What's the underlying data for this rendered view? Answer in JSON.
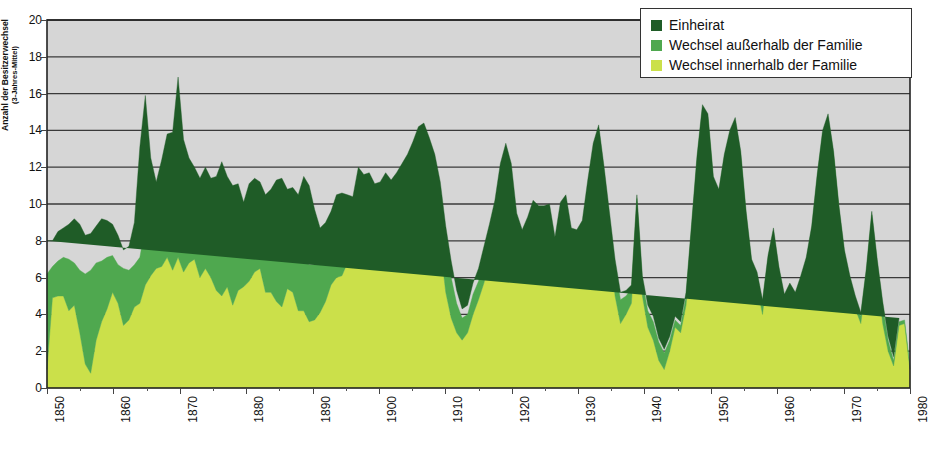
{
  "chart_data": {
    "type": "area",
    "stacked": true,
    "title": "",
    "xlabel": "",
    "ylabel": "Anzahl der Besitzerwechsel",
    "ylabel_sub": "(3-Jahres-Mittel)",
    "ylim": [
      0,
      20
    ],
    "ytick_step": 2,
    "yticks": [
      0,
      2,
      4,
      6,
      8,
      10,
      12,
      14,
      16,
      18,
      20
    ],
    "xlim": [
      1850,
      1980
    ],
    "xticks": [
      1850,
      1860,
      1870,
      1880,
      1890,
      1900,
      1910,
      1920,
      1930,
      1940,
      1950,
      1960,
      1970,
      1980
    ],
    "xtick_labels": [
      "1850",
      "1860",
      "1870",
      "1880",
      "1890",
      "1900",
      "1910",
      "1920",
      "1930",
      "1940",
      "1950",
      "1960",
      "1970",
      "1980"
    ],
    "x_minor_step": 5,
    "grid": true,
    "grid_axis": "y",
    "plot_background": "#d6d6d6",
    "legend_position": "top-right",
    "series": [
      {
        "name": "Wechsel innerhalb der Familie",
        "color": "#cbe04a",
        "stack_order": 1,
        "values": [
          1.0,
          4.9,
          5.0,
          5.0,
          4.2,
          4.5,
          3.0,
          1.3,
          0.8,
          2.6,
          3.6,
          4.3,
          5.2,
          4.6,
          3.4,
          3.7,
          4.4,
          4.6,
          5.6,
          6.1,
          6.5,
          6.6,
          7.1,
          6.4,
          7.1,
          6.3,
          6.8,
          7.0,
          6.0,
          6.5,
          6.0,
          5.3,
          5.0,
          5.5,
          4.5,
          5.3,
          5.5,
          5.8,
          6.3,
          6.5,
          5.2,
          5.2,
          4.7,
          4.4,
          5.4,
          5.2,
          4.2,
          4.2,
          3.6,
          3.7,
          4.1,
          4.7,
          5.6,
          6.0,
          6.1,
          6.8,
          7.2,
          8.7,
          7.2,
          7.1,
          6.6,
          7.1,
          8.0,
          8.3,
          9.0,
          9.3,
          10.0,
          10.7,
          11.1,
          11.7,
          10.5,
          9.4,
          7.8,
          5.2,
          3.8,
          3.0,
          2.6,
          3.0,
          4.0,
          4.8,
          5.7,
          6.9,
          8.4,
          10.5,
          11.4,
          10.2,
          7.2,
          6.3,
          7.4,
          8.5,
          8.4,
          8.5,
          8.5,
          6.3,
          8.5,
          9.2,
          7.0,
          6.8,
          7.5,
          9.9,
          12.0,
          13.3,
          10.7,
          7.8,
          5.0,
          3.5,
          4.0,
          4.6,
          9.6,
          5.0,
          3.3,
          2.6,
          1.5,
          1.0,
          2.0,
          3.3,
          3.0,
          4.5,
          8.0,
          11.8,
          14.7,
          14.3,
          11.0,
          10.3,
          12.0,
          13.2,
          14.0,
          12.3,
          9.0,
          6.3,
          5.5,
          4.0,
          6.5,
          8.0,
          6.0,
          4.5,
          5.0,
          4.5,
          5.3,
          6.2,
          8.0,
          11.0,
          13.5,
          14.5,
          12.5,
          9.5,
          7.0,
          5.5,
          4.3,
          3.5,
          6.0,
          9.0,
          6.0,
          3.5,
          2.0,
          1.2,
          3.4,
          3.5,
          1.0
        ]
      },
      {
        "name": "Wechsel außerhalb der Familie",
        "color": "#4fa84f",
        "stack_order": 2,
        "values": [
          5.2,
          1.7,
          1.9,
          2.1,
          2.8,
          2.3,
          3.4,
          4.9,
          5.6,
          4.2,
          3.3,
          2.8,
          2.0,
          2.1,
          3.1,
          2.7,
          2.3,
          2.5,
          3.2,
          2.2,
          1.9,
          1.8,
          2.7,
          3.3,
          4.0,
          3.2,
          2.7,
          2.1,
          2.4,
          2.6,
          2.4,
          2.6,
          2.8,
          2.7,
          3.5,
          2.8,
          2.4,
          2.8,
          2.2,
          2.3,
          2.8,
          2.9,
          3.1,
          3.0,
          2.4,
          2.5,
          2.9,
          2.8,
          3.1,
          3.0,
          2.6,
          2.4,
          2.0,
          2.2,
          2.5,
          2.3,
          2.0,
          1.5,
          2.4,
          2.6,
          2.8,
          2.6,
          2.3,
          2.0,
          1.7,
          1.9,
          1.6,
          1.4,
          1.5,
          1.2,
          1.7,
          2.0,
          2.3,
          2.6,
          2.2,
          1.6,
          1.2,
          1.0,
          1.1,
          1.0,
          1.2,
          1.1,
          1.0,
          0.9,
          0.9,
          1.0,
          1.5,
          1.7,
          1.4,
          1.2,
          1.1,
          1.0,
          1.0,
          1.4,
          1.1,
          0.9,
          1.3,
          1.4,
          1.2,
          1.0,
          0.9,
          0.8,
          1.0,
          1.3,
          1.5,
          1.3,
          1.0,
          0.8,
          0.7,
          0.8,
          0.9,
          1.0,
          1.0,
          0.9,
          0.6,
          0.4,
          0.4,
          0.5,
          0.7,
          0.6,
          0.5,
          0.4,
          0.3,
          0.3,
          0.5,
          0.6,
          0.5,
          0.4,
          0.4,
          0.5,
          0.6,
          0.6,
          0.5,
          0.5,
          0.4,
          0.4,
          0.5,
          0.5,
          0.6,
          0.7,
          0.6,
          0.4,
          0.3,
          0.2,
          0.2,
          0.2,
          0.3,
          0.4,
          0.5,
          0.4,
          0.3,
          0.4,
          0.8,
          1.0,
          0.6,
          0.3,
          0.2,
          0.2,
          0.2,
          0.2
        ]
      },
      {
        "name": "Einheirat",
        "color": "#1f5c27",
        "stack_order": 3,
        "values": [
          1.8,
          1.4,
          1.6,
          1.6,
          1.9,
          2.4,
          2.5,
          2.1,
          2.0,
          2.0,
          2.3,
          2.0,
          1.7,
          1.6,
          1.0,
          1.3,
          2.3,
          6.0,
          7.1,
          4.2,
          2.8,
          4.0,
          4.0,
          4.2,
          5.8,
          4.0,
          3.0,
          2.9,
          3.0,
          2.9,
          3.0,
          3.6,
          4.5,
          3.3,
          3.0,
          3.0,
          2.2,
          2.5,
          2.9,
          2.4,
          2.5,
          2.7,
          3.5,
          4.0,
          3.0,
          3.2,
          3.4,
          4.5,
          4.3,
          3.0,
          2.0,
          1.9,
          2.0,
          2.3,
          2.0,
          1.4,
          1.2,
          1.8,
          2.0,
          2.0,
          1.7,
          1.5,
          1.4,
          1.0,
          1.0,
          1.0,
          1.1,
          1.3,
          1.6,
          1.5,
          1.4,
          1.3,
          1.1,
          1.0,
          0.9,
          0.7,
          0.5,
          0.5,
          0.6,
          0.7,
          0.8,
          0.9,
          0.8,
          0.8,
          1.0,
          1.0,
          0.8,
          0.6,
          0.5,
          0.5,
          0.4,
          0.4,
          0.5,
          0.5,
          0.5,
          0.4,
          0.4,
          0.4,
          0.4,
          0.4,
          0.4,
          0.2,
          0.3,
          0.4,
          0.5,
          0.4,
          0.3,
          0.2,
          0.2,
          0.3,
          0.3,
          0.3,
          0.2,
          0.2,
          0.2,
          0.2,
          0.2,
          0.2,
          0.2,
          0.2,
          0.2,
          0.2,
          0.2,
          0.2,
          0.2,
          0.2,
          0.2,
          0.2,
          0.2,
          0.2,
          0.2,
          0.2,
          0.2,
          0.2,
          0.2,
          0.2,
          0.2,
          0.2,
          0.2,
          0.2,
          0.2,
          0.2,
          0.2,
          0.2,
          0.2,
          0.2,
          0.2,
          0.2,
          0.2,
          0.2,
          0.2,
          0.2,
          0.2,
          0.2,
          0.2,
          0.2,
          0.2
        ]
      }
    ]
  },
  "legend": {
    "items": [
      {
        "label": "Einheirat",
        "color": "#1f5c27"
      },
      {
        "label": "Wechsel außerhalb der Familie",
        "color": "#4fa84f"
      },
      {
        "label": "Wechsel innerhalb der Familie",
        "color": "#cbe04a"
      }
    ]
  },
  "axis": {
    "y_title_line1": "Anzahl der Besitzerwechsel",
    "y_title_line2": "(3-Jahres-Mittel)"
  }
}
